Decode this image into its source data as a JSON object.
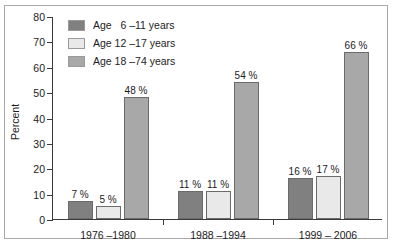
{
  "chart_data": {
    "type": "bar",
    "title": "",
    "xlabel": "",
    "ylabel": "Percent",
    "ylim": [
      0,
      80
    ],
    "yticks": [
      0,
      10,
      20,
      30,
      40,
      50,
      60,
      70,
      80
    ],
    "ytick_labels": [
      "0",
      "10",
      "20",
      "30",
      "40",
      "50",
      "60",
      "70",
      "80"
    ],
    "grid": false,
    "legend_position": "upper-left-inside",
    "categories": [
      "1976 –1980",
      "1988 –1994",
      "1999 – 2006"
    ],
    "series": [
      {
        "name": "Age   6 –11 years",
        "color": "#808080",
        "values": [
          7,
          11,
          16
        ],
        "labels": [
          "7 %",
          "11 %",
          "16 %"
        ]
      },
      {
        "name": "Age 12 –17 years",
        "color": "#e9e9e9",
        "values": [
          5,
          11,
          17
        ],
        "labels": [
          "5 %",
          "11 %",
          "17 %"
        ]
      },
      {
        "name": "Age 18 –74 years",
        "color": "#a8a8a8",
        "values": [
          48,
          54,
          66
        ],
        "labels": [
          "48 %",
          "54 %",
          "66 %"
        ]
      }
    ]
  },
  "colors": {
    "axis": "#3a3a3a",
    "frame": "#a9a9a9",
    "text": "#1c1c1c",
    "background": "#ffffff",
    "bar_outline": "#6b6b6b"
  }
}
